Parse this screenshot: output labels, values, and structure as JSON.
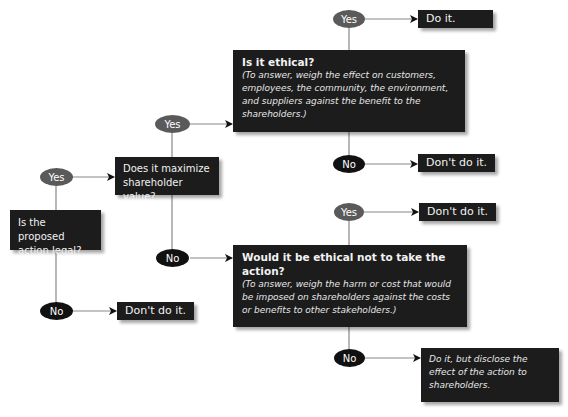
{
  "colors": {
    "box_fill": "#1c1c1c",
    "yes_oval": "#5a5a5a",
    "no_oval": "#111111",
    "connector": "#888888",
    "background": "#ffffff"
  },
  "nodes": {
    "legal_question": {
      "text": "Is the proposed action legal?"
    },
    "legal_yes": {
      "label": "Yes"
    },
    "legal_no": {
      "label": "No"
    },
    "legal_no_outcome": {
      "text": "Don't do it."
    },
    "maximize_question": {
      "text": "Does it maximize shareholder value?"
    },
    "maximize_yes": {
      "label": "Yes"
    },
    "maximize_no": {
      "label": "No"
    },
    "ethical_question": {
      "title": "Is it ethical?",
      "note": "(To answer, weigh the effect on customers, employees, the community, the environment, and suppliers against the benefit to the shareholders.)"
    },
    "ethical_yes": {
      "label": "Yes"
    },
    "ethical_yes_outcome": {
      "text": "Do it."
    },
    "ethical_no": {
      "label": "No"
    },
    "ethical_no_outcome": {
      "text": "Don't do it."
    },
    "not_act_question": {
      "title": "Would it be ethical not to take the action?",
      "note": "(To answer, weigh the harm or cost that would be imposed on shareholders against the costs or benefits to other stakeholders.)"
    },
    "not_act_yes": {
      "label": "Yes"
    },
    "not_act_yes_outcome": {
      "text": "Don't do it."
    },
    "not_act_no": {
      "label": "No"
    },
    "not_act_no_outcome": {
      "text": "Do it, but disclose the effect of the action to shareholders."
    }
  }
}
